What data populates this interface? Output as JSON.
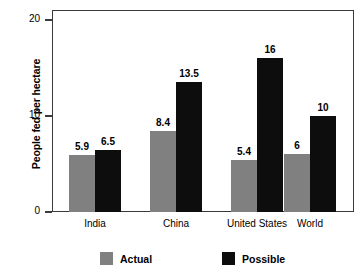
{
  "chart_data": {
    "type": "bar",
    "title": "",
    "xlabel": "",
    "ylabel": "People fed per hectare",
    "categories": [
      "India",
      "China",
      "United States",
      "World"
    ],
    "series": [
      {
        "name": "Actual",
        "color": "#808080",
        "values": [
          5.9,
          8.4,
          5.4,
          6
        ]
      },
      {
        "name": "Possible",
        "color": "#0d0d0d",
        "values": [
          6.5,
          13.5,
          16,
          10
        ]
      }
    ],
    "value_labels": {
      "actual": [
        "5.9",
        "8.4",
        "5.4",
        "6"
      ],
      "possible": [
        "6.5",
        "13.5",
        "16",
        "10"
      ]
    },
    "ylim": [
      0,
      21
    ],
    "yticks": [
      0,
      10,
      20
    ],
    "ytick_labels": [
      "0",
      "10",
      "20"
    ],
    "grid": false,
    "legend_position": "bottom",
    "legend": [
      "Actual",
      "Possible"
    ]
  },
  "axis": {
    "y_title": "People fed per hectare"
  },
  "legend": {
    "items": [
      {
        "label": "Actual"
      },
      {
        "label": "Possible"
      }
    ]
  }
}
